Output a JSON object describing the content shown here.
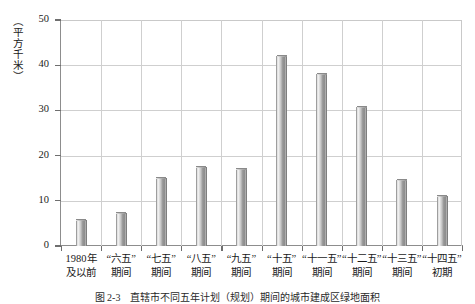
{
  "figure": {
    "ylabel": "（平方千米）",
    "caption_number": "图 2-3",
    "caption_text": "直辖市不同五年计划（规划）期间的城市建成区绿地面积"
  },
  "chart_data": {
    "type": "bar",
    "title": "",
    "xlabel": "",
    "ylabel": "（平方千米）",
    "ylim": [
      0,
      50
    ],
    "yticks": [
      0,
      10,
      20,
      30,
      40,
      50
    ],
    "ytick_labels": [
      "0",
      "10",
      "20",
      "30",
      "40",
      "50"
    ],
    "grid": true,
    "legend": "none",
    "categories": [
      "1980年及以前",
      "“六五”期间",
      "“七五”期间",
      "“八五”期间",
      "“九五”期间",
      "“十五”期间",
      "“十一五”期间",
      "“十二五”期间",
      "“十三五”期间",
      "“十四五”初期"
    ],
    "category_lines": [
      [
        "1980年",
        "及以前"
      ],
      [
        "“六五”",
        "期间"
      ],
      [
        "“七五”",
        "期间"
      ],
      [
        "“八五”",
        "期间"
      ],
      [
        "“九五”",
        "期间"
      ],
      [
        "“十五”",
        "期间"
      ],
      [
        "“十一五”",
        "期间"
      ],
      [
        "“十二五”",
        "期间"
      ],
      [
        "“十三五”",
        "期间"
      ],
      [
        "“十四五”",
        "初期"
      ]
    ],
    "values": [
      5.7,
      7.4,
      15.0,
      17.4,
      17.1,
      42.0,
      38.1,
      30.8,
      14.6,
      11.0
    ],
    "bar_color": "#a8a8a8",
    "grid_color": "#cfcfcf",
    "axis_color": "#8d8d8d"
  }
}
